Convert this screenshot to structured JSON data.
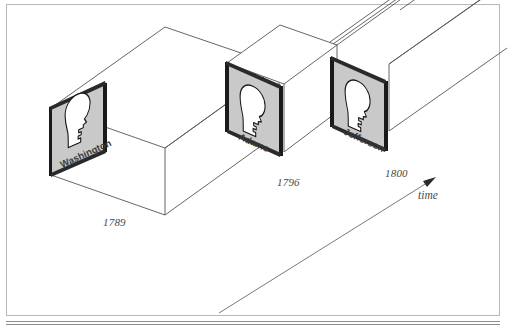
{
  "figure": {
    "frame_color": "#b8b8b8",
    "background": "#ffffff",
    "line_color": "#555555",
    "panel_fill": "#c9c9c9",
    "panel_edge": "#1a1a1a",
    "silhouette_fill": "#ffffff",
    "silhouette_stroke": "#1a1a1a",
    "text_color": "#4a4a4a"
  },
  "panels": [
    {
      "id": "panel-washington",
      "name": "Washington",
      "year": "1789",
      "icon": "head-silhouette-icon"
    },
    {
      "id": "panel-adams",
      "name": "Adams",
      "year": "1796",
      "icon": "head-silhouette-icon"
    },
    {
      "id": "panel-jefferson",
      "name": "Jefferson",
      "year": "1800",
      "icon": "head-silhouette-icon"
    }
  ],
  "axis": {
    "label": "time",
    "arrow": "arrow-up-right-icon"
  },
  "caption": {
    "text": ""
  }
}
